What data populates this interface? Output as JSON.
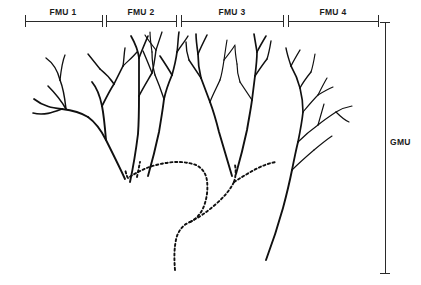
{
  "figure": {
    "background_color": "#ffffff",
    "ink_color": "#101010",
    "axis_color": "#2a2a2a"
  },
  "top_scale": {
    "name": "fmu-scale-bar",
    "segments": [
      {
        "label": "FMU 1",
        "start_x": 25,
        "end_x": 102,
        "label_x": 63,
        "label_y": 7
      },
      {
        "label": "FMU 2",
        "start_x": 106,
        "end_x": 176,
        "label_x": 141,
        "label_y": 7
      },
      {
        "label": "FMU 3",
        "start_x": 181,
        "end_x": 283,
        "label_x": 232,
        "label_y": 7
      },
      {
        "label": "FMU 4",
        "start_x": 288,
        "end_x": 378,
        "label_x": 333,
        "label_y": 7
      }
    ],
    "line_y": 21,
    "tick_half_height": 6
  },
  "right_scale": {
    "name": "gmu-bracket",
    "label": "GMU",
    "label_x": 390,
    "label_y": 137,
    "line_x": 385,
    "top_y": 22,
    "bottom_y": 273,
    "cap_half_width": 5
  },
  "tree": {
    "name": "branching-tree",
    "solid_color": "#101010",
    "dashed_color": "#101010",
    "dash_pattern": "2.2 2.6",
    "description": "Four FMU crowns of solid branches converging into a dashed GMU trunk",
    "crowns": [
      {
        "name": "fmu-1-crown",
        "paths": [
          "M 125 179 C 120 168, 112 152, 106 140 C 101 130, 95 122, 88 117",
          "M 88 117 C 80 112, 70 110, 62 109",
          "M 62 109 C 54 108, 44 107, 34 99",
          "M 62 109 C 54 112, 44 116, 33 113",
          "M 66 109 C 62 102, 56 94, 48 86",
          "M 66 109 C 65 100, 64 90, 60 80",
          "M 60 80 C 58 72, 53 63, 46 58",
          "M 60 80 C 61 71, 62 62, 65 55"
        ]
      },
      {
        "name": "fmu-1-mid-crown",
        "paths": [
          "M 106 140 C 105 128, 104 116, 102 106",
          "M 102 106 C 100 96, 97 88, 92 82",
          "M 102 106 C 106 98, 110 90, 114 84",
          "M 114 84 C 117 78, 120 72, 123 66",
          "M 114 84 C 110 78, 105 73, 100 69",
          "M 100 69 C 96 64, 92 59, 88 54",
          "M 123 66 C 124 60, 124 54, 125 48",
          "M 123 66 C 128 61, 133 57, 137 52"
        ]
      },
      {
        "name": "fmu-2-crown",
        "paths": [
          "M 130 182 C 133 168, 136 150, 138 134 C 139 120, 139 106, 139 96",
          "M 139 96 C 139 84, 139 70, 139 58",
          "M 139 58 C 138 50, 135 43, 131 36",
          "M 139 58 C 142 50, 145 43, 148 36",
          "M 139 96 C 143 88, 148 80, 152 73",
          "M 152 73 C 154 66, 155 58, 156 50",
          "M 152 73 C 149 65, 146 58, 143 51",
          "M 156 50 C 158 44, 160 38, 162 32",
          "M 156 50 C 152 45, 148 40, 145 35"
        ]
      },
      {
        "name": "fmu-2-right-crown",
        "paths": [
          "M 148 176 C 152 162, 156 146, 159 132 C 161 120, 163 108, 164 99",
          "M 164 99 C 166 90, 169 82, 172 75",
          "M 172 75 C 174 68, 176 60, 177 52",
          "M 172 75 C 168 68, 164 62, 160 56",
          "M 177 52 C 178 45, 178 38, 179 32",
          "M 177 52 C 181 46, 185 41, 188 36",
          "M 164 99 C 161 90, 158 82, 155 75",
          "M 155 75 C 153 68, 152 60, 152 52",
          "M 152 52 C 151 45, 150 38, 150 32"
        ]
      },
      {
        "name": "fmu-3-left-crown",
        "paths": [
          "M 232 176 C 228 162, 223 146, 219 132 C 216 120, 213 110, 210 102",
          "M 210 102 C 207 94, 204 86, 201 78",
          "M 201 78 C 199 70, 198 62, 198 54",
          "M 198 54 C 197 47, 196 40, 196 34",
          "M 198 54 C 201 47, 204 41, 207 35",
          "M 201 78 C 197 72, 193 66, 189 60",
          "M 189 60 C 187 54, 186 48, 186 42",
          "M 210 102 C 213 94, 217 87, 220 80",
          "M 220 80 C 222 74, 223 67, 224 60",
          "M 224 60 C 225 53, 226 46, 227 40",
          "M 224 60 C 228 55, 232 50, 235 45"
        ]
      },
      {
        "name": "fmu-3-right-crown",
        "paths": [
          "M 236 174 C 240 160, 244 144, 247 130 C 249 118, 251 108, 252 100",
          "M 252 100 C 253 92, 254 84, 255 76",
          "M 255 76 C 256 68, 257 60, 257 52",
          "M 257 52 C 256 46, 255 40, 254 34",
          "M 257 52 C 260 46, 263 41, 266 36",
          "M 255 76 C 259 70, 263 64, 267 59",
          "M 267 59 C 269 53, 270 47, 271 41",
          "M 252 100 C 248 94, 244 88, 240 82",
          "M 240 82 C 238 76, 237 70, 237 64",
          "M 237 64 C 236 58, 235 52, 235 46"
        ]
      },
      {
        "name": "fmu-4-crown",
        "paths": [
          "M 266 260 C 272 244, 278 226, 283 208 C 287 193, 290 180, 292 170",
          "M 292 170 C 294 160, 296 150, 298 142",
          "M 298 142 C 300 132, 302 122, 303 112",
          "M 303 112 C 303 104, 302 96, 300 88",
          "M 300 88 C 298 80, 295 73, 291 66",
          "M 291 66 C 289 60, 287 54, 286 48",
          "M 291 66 C 294 60, 297 55, 300 50",
          "M 300 88 C 303 82, 307 77, 311 72",
          "M 311 72 C 313 66, 314 60, 315 54",
          "M 303 112 C 308 106, 313 100, 318 95",
          "M 318 95 C 321 89, 324 83, 327 78",
          "M 318 95 C 323 92, 328 89, 333 87",
          "M 298 142 C 304 136, 311 130, 318 125",
          "M 318 125 C 324 120, 330 116, 336 112",
          "M 336 112 C 341 109, 346 107, 352 106",
          "M 336 112 C 340 116, 344 120, 349 122",
          "M 318 125 C 320 118, 322 111, 324 104",
          "M 292 170 C 299 163, 307 156, 314 150",
          "M 314 150 C 320 145, 326 140, 332 136"
        ]
      }
    ],
    "trunk": [
      {
        "name": "gmu-trunk-main",
        "path": "M 175 270 C 174 258, 174 246, 177 236 C 180 228, 185 224, 190 222"
      },
      {
        "name": "gmu-trunk-left-fork",
        "path": "M 190 222 C 196 219, 201 214, 204 206 C 207 198, 208 189, 207 181 C 206 173, 202 168, 196 165 C 188 162, 176 161, 166 163 C 152 165, 140 170, 128 178"
      },
      {
        "name": "gmu-trunk-left-to-crown",
        "path": "M 128 178 C 126 175, 126 172, 125 170"
      },
      {
        "name": "gmu-trunk-right-fork",
        "path": "M 190 222 C 198 218, 207 212, 216 204 C 224 197, 230 190, 234 182"
      },
      {
        "name": "gmu-trunk-right-up",
        "path": "M 234 182 C 236 176, 236 170, 235 165"
      },
      {
        "name": "gmu-trunk-right-branch",
        "path": "M 234 182 C 242 177, 250 172, 258 168 C 264 165, 270 163, 276 162"
      },
      {
        "name": "gmu-trunk-fmu2-link",
        "path": "M 137 177 C 138 172, 139 167, 140 162"
      }
    ]
  }
}
